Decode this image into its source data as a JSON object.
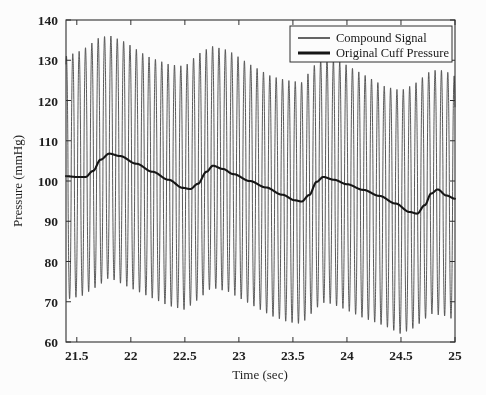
{
  "chart_data": {
    "type": "line",
    "title": "",
    "xlabel": "Time (sec)",
    "ylabel": "Pressure (mmHg)",
    "xlim": [
      21.4,
      25.0
    ],
    "ylim": [
      60,
      140
    ],
    "xticks": [
      21.5,
      22,
      22.5,
      23,
      23.5,
      24,
      24.5,
      25
    ],
    "xtick_labels": [
      "21.5",
      "22",
      "22.5",
      "23",
      "23.5",
      "24",
      "24.5",
      "25"
    ],
    "yticks": [
      60,
      70,
      80,
      90,
      100,
      110,
      120,
      130,
      140
    ],
    "ytick_labels": [
      "60",
      "70",
      "80",
      "90",
      "100",
      "110",
      "120",
      "130",
      "140"
    ],
    "grid": false,
    "legend_position": "top-right",
    "legend_entries": [
      "Compound Signal",
      "Original Cuff Pressure"
    ],
    "series": [
      {
        "name": "Compound Signal",
        "style": "thin",
        "color": "#3a3a3a",
        "description": "High-frequency cuff oscillation (~17 Hz) superimposed on the cuff pressure baseline, amplitude modulated by the cardiac cycle.",
        "oscillation_frequency_hz": 17.0,
        "envelope_x": [
          21.4,
          21.55,
          21.7,
          21.8,
          21.95,
          22.15,
          22.35,
          22.5,
          22.62,
          22.75,
          22.9,
          23.1,
          23.3,
          23.45,
          23.58,
          23.72,
          23.8,
          23.95,
          24.15,
          24.35,
          24.5,
          24.62,
          24.78,
          24.9,
          25.0
        ],
        "envelope_upper": [
          131.0,
          132.5,
          135.5,
          136.2,
          134.5,
          131.0,
          129.0,
          128.5,
          131.5,
          133.5,
          132.5,
          129.0,
          126.0,
          125.0,
          124.5,
          129.5,
          130.5,
          129.5,
          126.5,
          123.5,
          122.5,
          124.0,
          127.5,
          127.5,
          126.0
        ],
        "envelope_lower": [
          70.5,
          71.5,
          74.0,
          76.0,
          74.0,
          71.5,
          69.0,
          68.0,
          70.5,
          73.5,
          72.5,
          69.5,
          66.5,
          65.0,
          64.5,
          68.5,
          70.0,
          68.5,
          66.0,
          64.0,
          62.0,
          63.5,
          67.0,
          66.5,
          65.5
        ]
      },
      {
        "name": "Original Cuff Pressure",
        "style": "thick",
        "color": "#111111",
        "description": "Slowly deflating cuff pressure baseline showing the cardiac pulse sawtooth pattern.",
        "x": [
          21.4,
          21.5,
          21.58,
          21.65,
          21.72,
          21.8,
          21.9,
          22.05,
          22.2,
          22.35,
          22.48,
          22.55,
          22.62,
          22.7,
          22.76,
          22.85,
          22.95,
          23.1,
          23.25,
          23.4,
          23.52,
          23.58,
          23.65,
          23.72,
          23.78,
          23.88,
          24.0,
          24.15,
          24.3,
          24.45,
          24.58,
          24.65,
          24.72,
          24.78,
          24.84,
          24.92,
          25.0
        ],
        "y": [
          101.2,
          101.0,
          101.0,
          102.5,
          105.3,
          106.8,
          106.2,
          104.3,
          102.3,
          100.3,
          98.3,
          98.0,
          99.3,
          102.3,
          103.8,
          103.0,
          101.7,
          100.0,
          98.4,
          96.6,
          95.2,
          94.9,
          96.5,
          99.8,
          101.0,
          100.3,
          99.2,
          97.8,
          96.3,
          94.4,
          92.3,
          91.9,
          94.0,
          96.9,
          97.9,
          96.4,
          95.6
        ]
      }
    ]
  }
}
